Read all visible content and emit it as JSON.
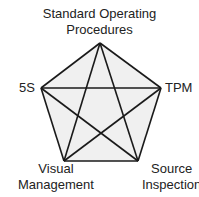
{
  "diagram": {
    "type": "complete-graph-pentagon",
    "nodes": [
      {
        "id": "sop",
        "label_line1": "Standard Operating",
        "label_line2": "Procedures"
      },
      {
        "id": "tpm",
        "label_line1": "TPM"
      },
      {
        "id": "source",
        "label_line1": "Source",
        "label_line2": "Inspection"
      },
      {
        "id": "visual",
        "label_line1": "Visual",
        "label_line2": "Management"
      },
      {
        "id": "5s",
        "label_line1": "5S"
      }
    ],
    "edges": [
      [
        "sop",
        "tpm"
      ],
      [
        "tpm",
        "source"
      ],
      [
        "source",
        "visual"
      ],
      [
        "visual",
        "5s"
      ],
      [
        "5s",
        "sop"
      ],
      [
        "sop",
        "source"
      ],
      [
        "sop",
        "visual"
      ],
      [
        "tpm",
        "visual"
      ],
      [
        "tpm",
        "5s"
      ],
      [
        "5s",
        "source"
      ]
    ],
    "colors": {
      "fill": "#f0f0f0",
      "stroke": "#1a1a1a"
    }
  }
}
